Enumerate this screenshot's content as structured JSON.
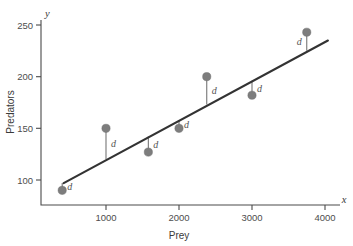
{
  "chart_data": {
    "type": "scatter",
    "title": "",
    "xlabel": "Prey",
    "ylabel": "Predators",
    "x_axis_var": "x",
    "y_axis_var": "y",
    "xlim": [
      0,
      4200
    ],
    "ylim": [
      75,
      262
    ],
    "xticks": [
      1000,
      2000,
      3000,
      4000
    ],
    "xtick_labels": [
      "1000",
      "2000",
      "3000",
      "4000"
    ],
    "yticks": [
      100,
      150,
      200,
      250
    ],
    "ytick_labels": [
      "100",
      "150",
      "200",
      "250"
    ],
    "grid": false,
    "legend": null,
    "points": [
      {
        "x": 400,
        "y": 90,
        "fit": 97,
        "residual_label": "d",
        "label_side": "right"
      },
      {
        "x": 1000,
        "y": 150,
        "fit": 120,
        "residual_label": "d",
        "label_side": "right"
      },
      {
        "x": 1580,
        "y": 127,
        "fit": 142,
        "residual_label": "d",
        "label_side": "right"
      },
      {
        "x": 2000,
        "y": 150,
        "fit": 158,
        "residual_label": "d",
        "label_side": "right"
      },
      {
        "x": 2380,
        "y": 200,
        "fit": 173,
        "residual_label": "d",
        "label_side": "right"
      },
      {
        "x": 3000,
        "y": 182,
        "fit": 196,
        "residual_label": "d",
        "label_side": "right"
      },
      {
        "x": 3750,
        "y": 243,
        "fit": 225,
        "residual_label": "d",
        "label_side": "left"
      }
    ],
    "fit_line": {
      "name": "least-squares regression line",
      "x_start": 420,
      "y_start": 97,
      "x_end": 4040,
      "y_end": 235
    },
    "annotation_note": "Each vertical segment labeled d is the residual distance from a data point to the regression line.",
    "colors": {
      "point": "#7d7d7d",
      "fit_line": "#333333",
      "residual": "#767676",
      "axis": "#4a4a4a",
      "text": "#3a3a3a",
      "background": "#ffffff"
    }
  }
}
